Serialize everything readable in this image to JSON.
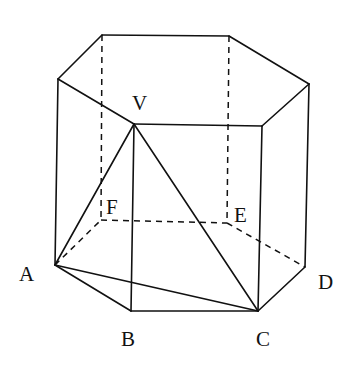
{
  "figure": {
    "type": "hexagonal prism with inscribed pyramid",
    "colors": {
      "line": "#111111",
      "background": "#ffffff"
    },
    "vertices": {
      "V": [
        134,
        124
      ],
      "A": [
        55,
        265
      ],
      "B": [
        131,
        311
      ],
      "C": [
        258,
        311
      ],
      "D": [
        305,
        267
      ],
      "E": [
        227,
        223
      ],
      "F": [
        101,
        220
      ],
      "TA": [
        58,
        79
      ],
      "TF": [
        102,
        35
      ],
      "TE": [
        229,
        36
      ],
      "TD": [
        309,
        84
      ],
      "TC": [
        262,
        126
      ]
    },
    "solid_edges": [
      [
        "TA",
        "TF"
      ],
      [
        "TF",
        "TE"
      ],
      [
        "TE",
        "TD"
      ],
      [
        "TD",
        "TC"
      ],
      [
        "TC",
        "V"
      ],
      [
        "V",
        "TA"
      ],
      [
        "TA",
        "A"
      ],
      [
        "V",
        "B"
      ],
      [
        "TC",
        "C"
      ],
      [
        "TD",
        "D"
      ],
      [
        "A",
        "B"
      ],
      [
        "B",
        "C"
      ],
      [
        "C",
        "D"
      ],
      [
        "V",
        "A"
      ],
      [
        "V",
        "C"
      ],
      [
        "A",
        "C"
      ]
    ],
    "dashed_edges": [
      [
        "TF",
        "F"
      ],
      [
        "TE",
        "E"
      ],
      [
        "A",
        "F"
      ],
      [
        "F",
        "E"
      ],
      [
        "E",
        "D"
      ]
    ]
  },
  "labels": [
    {
      "id": "V",
      "text": "V",
      "x": 132,
      "y": 93
    },
    {
      "id": "F",
      "text": "F",
      "x": 106,
      "y": 197
    },
    {
      "id": "E",
      "text": "E",
      "x": 234,
      "y": 205
    },
    {
      "id": "A",
      "text": "A",
      "x": 19,
      "y": 264
    },
    {
      "id": "D",
      "text": "D",
      "x": 318,
      "y": 272
    },
    {
      "id": "B",
      "text": "B",
      "x": 121,
      "y": 329
    },
    {
      "id": "C",
      "text": "C",
      "x": 256,
      "y": 329
    }
  ]
}
